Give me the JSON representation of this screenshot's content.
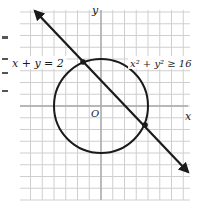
{
  "chart_data": {
    "type": "diagram",
    "title": "",
    "grid": {
      "on": true,
      "x_range": [
        -7,
        8
      ],
      "y_range": [
        -8,
        9
      ],
      "unit_px": 11.75,
      "color": "#c8c8c8"
    },
    "axes": {
      "x_label": "x",
      "y_label": "y",
      "origin_label": "O"
    },
    "curves": [
      {
        "kind": "line",
        "equation": "x + y = 2",
        "label": "x + y = 2",
        "arrows": "both",
        "from": [
          -5,
          7.8
        ],
        "to": [
          6.3,
          -4.3
        ]
      },
      {
        "kind": "circle",
        "equation": "x² + y² ≥ 16",
        "label": "x² + y² ≥ 16",
        "center": [
          0,
          0
        ],
        "radius": 4
      }
    ],
    "intersection_points": [
      {
        "x": -1.65,
        "y": 3.65
      },
      {
        "x": 3.65,
        "y": -1.65
      }
    ]
  },
  "labels": {
    "line": "x + y = 2",
    "circle": "x² + y² ≥ 16",
    "x_axis": "x",
    "y_axis": "y",
    "origin": "O"
  },
  "colors": {
    "ink": "#1a1a1a",
    "grid": "#c8c8c8",
    "axis": "#a8a8a8"
  }
}
